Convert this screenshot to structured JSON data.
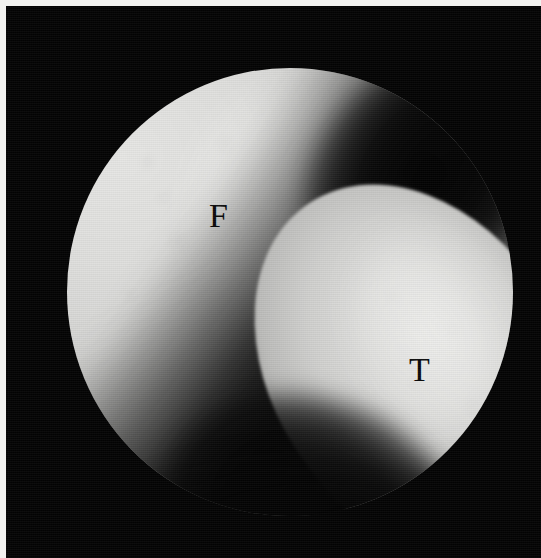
{
  "image": {
    "kind": "arthroscopic-photograph",
    "modality": "knee arthroscopy",
    "width_px": 541,
    "height_px": 558,
    "background_color": "#040404",
    "border_color": "#f2f2f0",
    "alt_text": "Black and white arthroscopic photograph of a knee joint showing the femoral condyle labelled F and the tibial plateau labelled T separated by a dark joint space."
  },
  "scope": {
    "shape": "circle",
    "center_x": 289,
    "center_y": 290,
    "radius": 223,
    "field_label": "endoscopic field of view"
  },
  "labels": [
    {
      "id": "femur",
      "text": "F",
      "meaning": "femur",
      "color": "#0a0a0a",
      "x": 213,
      "y": 210
    },
    {
      "id": "tibia",
      "text": "T",
      "meaning": "tibia",
      "color": "#0a0a0a",
      "x": 415,
      "y": 364
    }
  ],
  "regions": {
    "femur": {
      "name": "femoral condyle",
      "tone": "#d8d8d6",
      "position": "upper-left"
    },
    "tibia": {
      "name": "tibial plateau",
      "tone": "#d2d2d0",
      "position": "lower-right"
    },
    "joint_space": {
      "name": "joint space",
      "tone": "#070707",
      "position": "diagonal band, upper-right to lower-left"
    },
    "inferior_recess": {
      "name": "inferior recess",
      "tone": "#050505",
      "position": "lower-centre"
    }
  }
}
